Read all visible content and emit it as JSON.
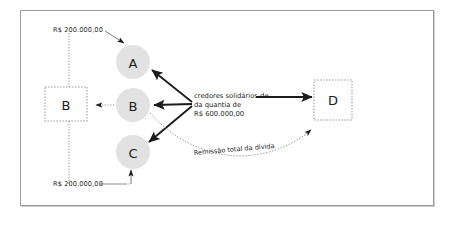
{
  "diagram": {
    "frame_color": "#9a9a9a",
    "background": "#ffffff",
    "nodes": {
      "circle_a": "A",
      "circle_b": "B",
      "circle_c": "C",
      "square_b": "B",
      "square_d": "D"
    },
    "labels": {
      "amount_top": "R$ 200.000,00",
      "amount_bottom": "R$ 200.000,00",
      "center_line1": "credores solidários de",
      "center_line2": "da quantia de",
      "center_line3": "R$ 600.000,00",
      "curve_label": "Remissão total da dívida"
    },
    "colors": {
      "circle_fill": "#e2e2e2",
      "square_stroke": "#9d9d9d",
      "solid_arrow": "#1c1c1c",
      "dotted_line": "#8c8c8c",
      "text": "#1f1f1f"
    }
  }
}
